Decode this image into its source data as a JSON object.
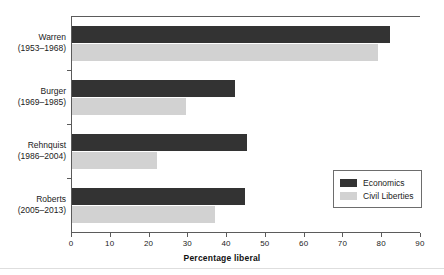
{
  "chart_data": {
    "type": "bar",
    "orientation": "horizontal",
    "title": "",
    "xlabel": "Percentage liberal",
    "ylabel": "",
    "xlim": [
      0,
      90
    ],
    "xticks": [
      0,
      10,
      20,
      30,
      40,
      50,
      60,
      70,
      80,
      90
    ],
    "grid": false,
    "legend_position": "bottom-right",
    "categories": [
      "Warren",
      "Burger",
      "Rehnquist",
      "Roberts"
    ],
    "category_years": [
      "(1953–1968)",
      "(1969–1985)",
      "(1986–2004)",
      "(2005–2013)"
    ],
    "series": [
      {
        "name": "Economics",
        "color": "#333333",
        "values": [
          82,
          42,
          45,
          44.5
        ]
      },
      {
        "name": "Civil Liberties",
        "color": "#d2d2d2",
        "values": [
          79,
          29.5,
          22,
          37
        ]
      }
    ]
  },
  "axis": {
    "x_title": "Percentage liberal",
    "tick_labels": [
      "0",
      "10",
      "20",
      "30",
      "40",
      "50",
      "60",
      "70",
      "80",
      "90"
    ]
  },
  "legend": {
    "items": [
      {
        "label": "Economics",
        "color": "#333333"
      },
      {
        "label": "Civil Liberties",
        "color": "#d2d2d2"
      }
    ]
  },
  "categories": [
    {
      "name": "Warren",
      "years": "(1953–1968)"
    },
    {
      "name": "Burger",
      "years": "(1969–1985)"
    },
    {
      "name": "Rehnquist",
      "years": "(1986–2004)"
    },
    {
      "name": "Roberts",
      "years": "(2005–2013)"
    }
  ]
}
